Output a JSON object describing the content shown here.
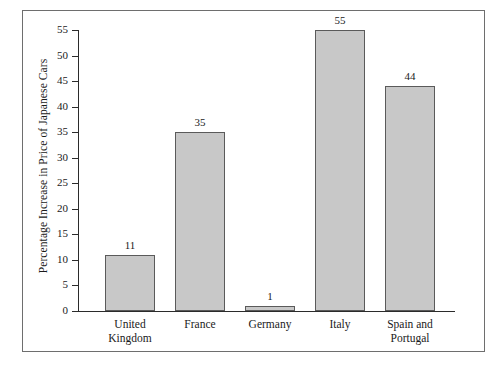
{
  "chart_data": {
    "type": "bar",
    "title": "",
    "subtitle": "",
    "xlabel": "",
    "ylabel": "Percentage Increase in Price of Japanese Cars",
    "categories": [
      "United Kingdom",
      "France",
      "Germany",
      "Italy",
      "Spain and Portugal"
    ],
    "category_lines": [
      [
        "United",
        "Kingdom"
      ],
      [
        "France"
      ],
      [
        "Germany"
      ],
      [
        "Italy"
      ],
      [
        "Spain and",
        "Portugal"
      ]
    ],
    "values": [
      11,
      35,
      1,
      55,
      44
    ],
    "value_labels": [
      "11",
      "35",
      "1",
      "55",
      "44"
    ],
    "ylim": [
      0,
      55
    ],
    "y_ticks": [
      0,
      5,
      10,
      15,
      20,
      25,
      30,
      35,
      40,
      45,
      50,
      55
    ],
    "y_tick_labels": [
      "0",
      "5",
      "10",
      "15",
      "20",
      "25",
      "30",
      "35",
      "40",
      "45",
      "50",
      "55"
    ],
    "grid": false,
    "legend": null,
    "legend_position": "none",
    "bar_fill_color": "#c8c8c8",
    "bar_border_color": "#5a5a5a",
    "axis_color": "#2b2b2b",
    "frame_color": "#6e6e6e",
    "background_color": "#ffffff",
    "text_color": "#1a1a1a"
  }
}
